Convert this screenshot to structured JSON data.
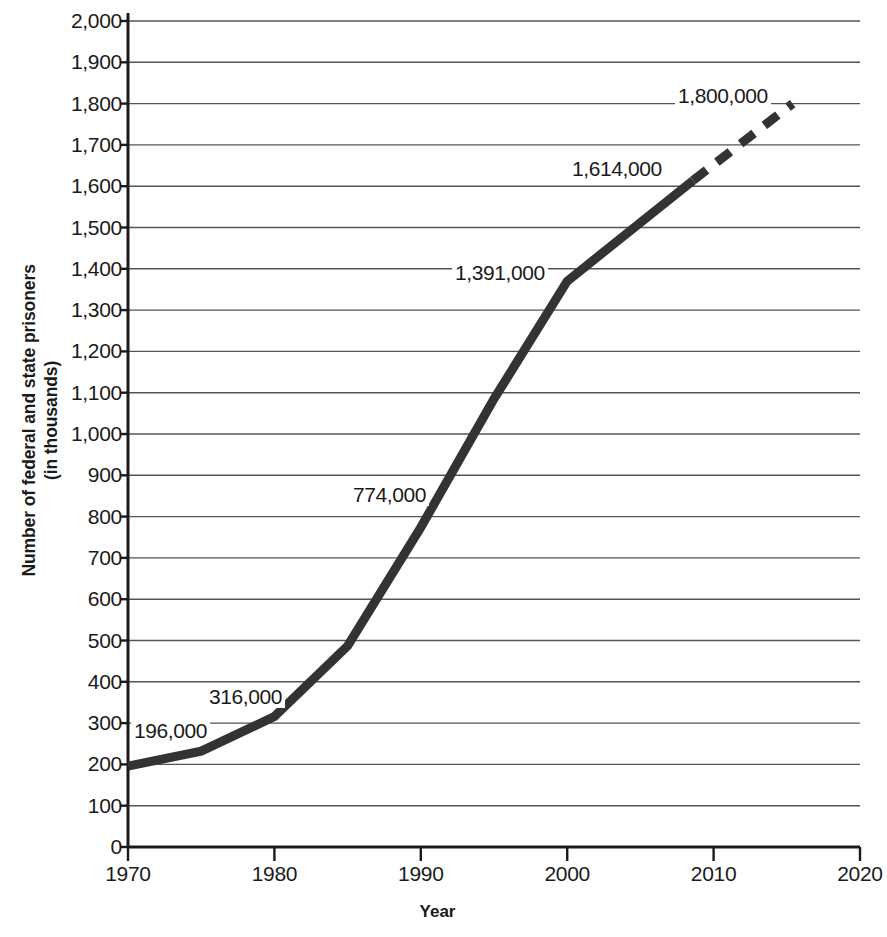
{
  "chart_data": {
    "type": "line",
    "title": "",
    "xlabel": "Year",
    "ylabel": "Number of federal and state prisoners\n(in thousands)",
    "xlim": [
      1970,
      2020
    ],
    "ylim": [
      0,
      2000
    ],
    "grid": true,
    "legend": "none",
    "x_ticks": [
      "1970",
      "1980",
      "1990",
      "2000",
      "2010",
      "2020"
    ],
    "x_tick_values": [
      1970,
      1980,
      1990,
      2000,
      2010,
      2020
    ],
    "y_ticks": [
      "0",
      "100",
      "200",
      "300",
      "400",
      "500",
      "600",
      "700",
      "800",
      "900",
      "1,000",
      "1,100",
      "1,200",
      "1,300",
      "1,400",
      "1,500",
      "1,600",
      "1,700",
      "1,800",
      "1,900",
      "2,000"
    ],
    "y_tick_values": [
      0,
      100,
      200,
      300,
      400,
      500,
      600,
      700,
      800,
      900,
      1000,
      1100,
      1200,
      1300,
      1400,
      1500,
      1600,
      1700,
      1800,
      1900,
      2000
    ],
    "series": [
      {
        "name": "Federal and state prisoners (solid, actual)",
        "style": "solid",
        "color": "#333333",
        "x": [
          1970,
          1975,
          1980,
          1985,
          1990,
          1995,
          2000,
          2008.6
        ],
        "values": [
          196,
          232,
          316,
          487,
          774,
          1085,
          1370,
          1614
        ]
      },
      {
        "name": "Federal and state prisoners (dashed, projected)",
        "style": "dashed",
        "color": "#333333",
        "x": [
          2008.6,
          2015.4
        ],
        "values": [
          1614,
          1800
        ]
      }
    ],
    "point_labels": [
      {
        "text": "196,000",
        "x": 1970,
        "y": 196,
        "left": 131,
        "top": 720
      },
      {
        "text": "316,000",
        "x": 1980,
        "y": 316,
        "left": 206,
        "top": 686
      },
      {
        "text": "774,000",
        "x": 1990,
        "y": 774,
        "left": 350,
        "top": 484
      },
      {
        "text": "1,391,000",
        "x": 2000,
        "y": 1391,
        "left": 452,
        "top": 262
      },
      {
        "text": "1,614,000",
        "x": 2008.6,
        "y": 1614,
        "left": 569,
        "top": 158
      },
      {
        "text": "1,800,000",
        "x": 2015.4,
        "y": 1800,
        "left": 675,
        "top": 85
      }
    ],
    "colors": {
      "line": "#333333",
      "gridline": "#555555",
      "axis": "#1a1a1a",
      "background": "#ffffff"
    }
  }
}
